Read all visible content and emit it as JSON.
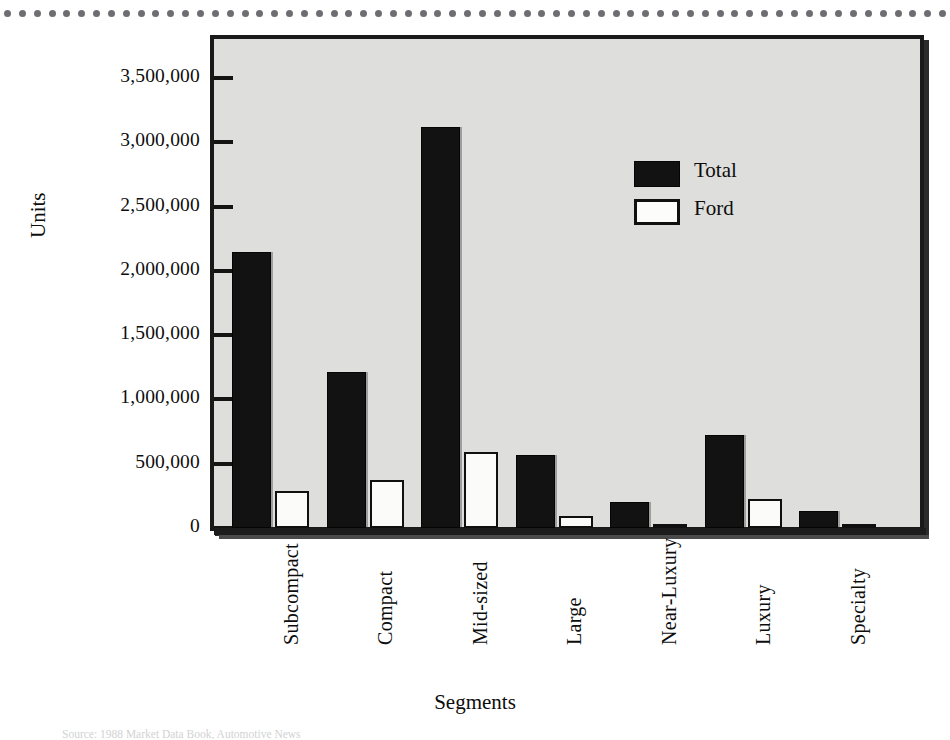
{
  "chart_data": {
    "type": "bar",
    "title": "",
    "xlabel": "Segments",
    "ylabel": "Units",
    "categories": [
      "Subcompact",
      "Compact",
      "Mid-sized",
      "Large",
      "Near-Luxury",
      "Luxury",
      "Specialty"
    ],
    "series": [
      {
        "name": "Total",
        "color": "#121212",
        "values": [
          2150000,
          1215000,
          3120000,
          565000,
          200000,
          725000,
          135000
        ]
      },
      {
        "name": "Ford",
        "color": "#ffffff",
        "values": [
          285000,
          375000,
          590000,
          95000,
          30000,
          225000,
          28000
        ]
      }
    ],
    "ylim": [
      0,
      3500000
    ],
    "ytick_values": [
      0,
      500000,
      1000000,
      1500000,
      2000000,
      2500000,
      3000000,
      3500000
    ],
    "ytick_labels": [
      "0",
      "500,000",
      "1,000,000",
      "1,500,000",
      "2,000,000",
      "2,500,000",
      "3,000,000",
      "3,500,000"
    ],
    "grid": false,
    "legend_position": "upper-right",
    "legend_entries": [
      "Total",
      "Ford"
    ],
    "xtick_rotation": 90
  },
  "figure": {
    "plot_background": "#dededc",
    "frame_color": "#191919",
    "axis_color": "#1c1c1c",
    "text_color": "#0d0d0d"
  },
  "decoration": {
    "dot_rule_color": "#6e6e72",
    "dot_count": 64
  },
  "source_caption": "Source: 1988 Market Data Book, Automotive News"
}
